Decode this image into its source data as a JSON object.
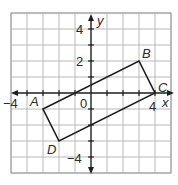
{
  "diagram": {
    "type": "coordinate-plane",
    "grid": {
      "xmin": -5,
      "xmax": 5,
      "ymin": -5,
      "ymax": 5,
      "step": 1
    },
    "axes": {
      "x_label": "x",
      "y_label": "y"
    },
    "tick_labels": {
      "x_neg": "−4",
      "x_pos": "4",
      "y_pos_4": "4",
      "y_pos_2": "2",
      "y_neg_4": "−4",
      "origin": "0"
    },
    "polygon": {
      "name": "ABCD",
      "vertices": [
        {
          "label": "A",
          "x": -3,
          "y": -1
        },
        {
          "label": "B",
          "x": 3,
          "y": 2
        },
        {
          "label": "C",
          "x": 4,
          "y": 0
        },
        {
          "label": "D",
          "x": -2,
          "y": -3
        }
      ]
    },
    "colors": {
      "grid": "#b9b9b9",
      "lines": "#1e1e1e",
      "text": "#2a2a2a"
    }
  }
}
